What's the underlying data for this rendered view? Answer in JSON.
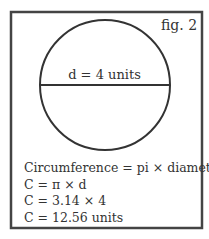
{
  "figure_label": "fig. 2",
  "diameter_label": "d = 4 units",
  "equations": [
    "Circumference = pi × diameter",
    "C = π × d",
    "C = 3.14 × 4",
    "C = 12.56 units"
  ],
  "colors": {
    "stroke": "#333333",
    "background": "#ffffff"
  }
}
